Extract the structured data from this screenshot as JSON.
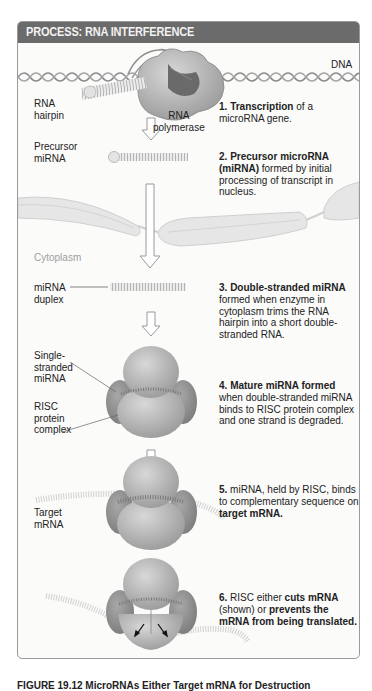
{
  "page_top_faint_text": "",
  "header": {
    "title": "PROCESS: RNA INTERFERENCE"
  },
  "labels": {
    "dna": "DNA",
    "rna_hairpin_1": "RNA",
    "rna_hairpin_2": "hairpin",
    "rna_polymerase_1": "RNA",
    "rna_polymerase_2": "polymerase",
    "precursor_mirna_1": "Precursor",
    "precursor_mirna_2": "miRNA",
    "cytoplasm": "Cytoplasm",
    "mirna_duplex_1": "miRNA",
    "mirna_duplex_2": "duplex",
    "single_stranded_1": "Single-",
    "single_stranded_2": "stranded",
    "single_stranded_3": "miRNA",
    "risc_1": "RISC",
    "risc_2": "protein",
    "risc_3": "complex",
    "target_mrna_1": "Target",
    "target_mrna_2": "mRNA"
  },
  "steps": [
    {
      "num": "1.",
      "bold": "Transcription",
      "rest": " of a microRNA gene."
    },
    {
      "num": "2.",
      "bold": "Precursor microRNA (miRNA)",
      "rest": " formed by initial processing of transcript in nucleus."
    },
    {
      "num": "3.",
      "bold": "Double-stranded miRNA",
      "rest": " formed when enzyme in cytoplasm trims the RNA hairpin into a short double-stranded RNA."
    },
    {
      "num": "4.",
      "bold": "Mature miRNA formed",
      "rest": " when double-stranded miRNA binds to RISC protein complex and one strand is degraded."
    },
    {
      "num": "5.",
      "pre": " miRNA, held by RISC, binds to complementary sequence on ",
      "bold": "target mRNA."
    },
    {
      "num": "6.",
      "pre": " RISC either ",
      "bold": "cuts mRNA",
      "mid": " (shown) or ",
      "bold2": "prevents the mRNA from being translated."
    }
  ],
  "caption": "FIGURE 19.12 MicroRNAs Either Target mRNA for Destruction",
  "colors": {
    "header_bg": "#6b6b6b",
    "panel_border": "#9a9a9a",
    "protein": "#b9b9b9",
    "rna": "#d6d6d6"
  }
}
